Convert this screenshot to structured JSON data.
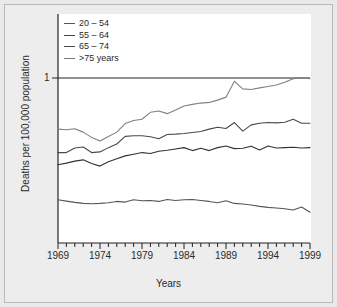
{
  "figure": {
    "background_color": "#e9e9e9",
    "plot_background_color": "#ffffff",
    "border_color": "#b9b9b9"
  },
  "axis": {
    "ylabel": "Deaths per 100,000 population",
    "xlabel": "Years",
    "ytick_label": "1",
    "xtick_labels": [
      "1969",
      "1974",
      "1979",
      "1984",
      "1989",
      "1994",
      "1999"
    ]
  },
  "legend": {
    "entries": [
      {
        "label": "20 – 54",
        "color": "#555555"
      },
      {
        "label": "55 – 64",
        "color": "#444444"
      },
      {
        "label": "65 – 74",
        "color": "#4a4a4a"
      },
      {
        "label": ">75 years",
        "color": "#777777"
      }
    ]
  },
  "chart_data": {
    "type": "line",
    "title": "",
    "subtitle": "",
    "xlabel": "Years",
    "ylabel": "Deaths per 100,000 population",
    "xlim": [
      1969,
      1999
    ],
    "ylim": [
      0.0,
      1.12
    ],
    "yscale": "log-like relative index, reference line drawn at 1",
    "grid": false,
    "gridline_at": 1,
    "legend_position": "top-left",
    "xtick_labels": [
      "1969",
      "1974",
      "1979",
      "1984",
      "1989",
      "1994",
      "1999"
    ],
    "xtick_minor_every": 1,
    "ytick_labels": [
      "1"
    ],
    "x": [
      1969,
      1970,
      1971,
      1972,
      1973,
      1974,
      1975,
      1976,
      1977,
      1978,
      1979,
      1980,
      1981,
      1982,
      1983,
      1984,
      1985,
      1986,
      1987,
      1988,
      1989,
      1990,
      1991,
      1992,
      1993,
      1994,
      1995,
      1996,
      1997,
      1998,
      1999
    ],
    "series": [
      {
        "name": ">75 years",
        "color": "#808080",
        "values": [
          0.69,
          0.686,
          0.692,
          0.672,
          0.64,
          0.618,
          0.645,
          0.672,
          0.724,
          0.742,
          0.75,
          0.792,
          0.8,
          0.784,
          0.806,
          0.83,
          0.84,
          0.848,
          0.852,
          0.866,
          0.884,
          0.98,
          0.934,
          0.93,
          0.94,
          0.948,
          0.958,
          0.974,
          0.996,
          1.002,
          0.996
        ]
      },
      {
        "name": "65 – 74",
        "color": "#4a4a4a",
        "values": [
          0.548,
          0.548,
          0.576,
          0.582,
          0.548,
          0.552,
          0.578,
          0.6,
          0.646,
          0.65,
          0.65,
          0.644,
          0.632,
          0.658,
          0.66,
          0.664,
          0.67,
          0.676,
          0.69,
          0.702,
          0.694,
          0.73,
          0.678,
          0.716,
          0.726,
          0.73,
          0.728,
          0.732,
          0.75,
          0.726,
          0.726
        ]
      },
      {
        "name": "55 – 64",
        "color": "#333333",
        "values": [
          0.474,
          0.484,
          0.496,
          0.504,
          0.482,
          0.466,
          0.492,
          0.51,
          0.528,
          0.538,
          0.548,
          0.542,
          0.556,
          0.562,
          0.57,
          0.578,
          0.56,
          0.574,
          0.56,
          0.578,
          0.588,
          0.572,
          0.574,
          0.586,
          0.564,
          0.588,
          0.576,
          0.578,
          0.58,
          0.576,
          0.578
        ]
      },
      {
        "name": "20 – 54",
        "color": "#555555",
        "values": [
          0.262,
          0.254,
          0.246,
          0.24,
          0.238,
          0.24,
          0.244,
          0.252,
          0.248,
          0.262,
          0.256,
          0.258,
          0.252,
          0.264,
          0.258,
          0.262,
          0.264,
          0.258,
          0.252,
          0.244,
          0.256,
          0.24,
          0.236,
          0.23,
          0.222,
          0.216,
          0.212,
          0.208,
          0.2,
          0.218,
          0.186
        ]
      }
    ]
  }
}
